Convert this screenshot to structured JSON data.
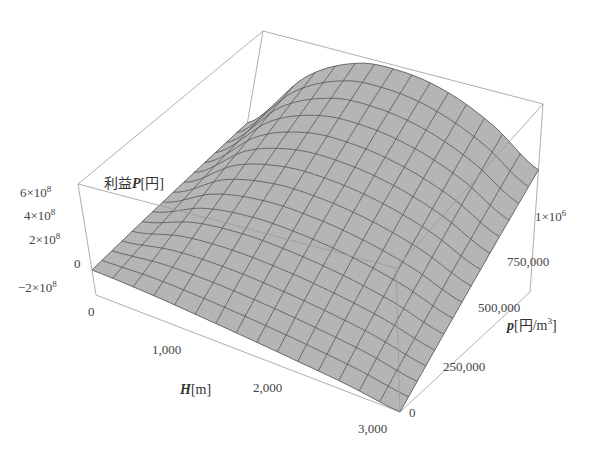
{
  "chart_data": {
    "type": "surface3d",
    "title": "",
    "x_axis": {
      "label_var": "H",
      "label_unit": "[m]",
      "ticks": [
        "0",
        "1,000",
        "2,000",
        "3,000"
      ],
      "range": [
        0,
        3000
      ]
    },
    "y_axis": {
      "label_var": "p",
      "label_unit": "[円/m",
      "label_unit_sup": "3",
      "label_unit_end": "]",
      "ticks": [
        "0",
        "250,000",
        "500,000",
        "750,000",
        "1×10"
      ],
      "tick_last_sup": "6",
      "range": [
        0,
        1000000
      ]
    },
    "z_axis": {
      "label_prefix": "利益",
      "label_var": "P",
      "label_unit": "[円]",
      "ticks": [
        {
          "mant": "6×10",
          "exp": "8"
        },
        {
          "mant": "4×10",
          "exp": "8"
        },
        {
          "mant": "2×10",
          "exp": "8"
        },
        {
          "mant": "0",
          "exp": ""
        },
        {
          "mant": "−2×10",
          "exp": "8"
        }
      ],
      "range": [
        -200000000,
        600000000
      ]
    },
    "surface": {
      "description": "Profit P as a function of height H and price p; rises with p, peaks at intermediate H near 1,000–1,500 m and falls toward H=3,000",
      "mesh_lines": 15,
      "samples_H": [
        0,
        500,
        1000,
        1500,
        2000,
        2500,
        3000
      ],
      "samples_p": [
        0,
        250000,
        500000,
        750000,
        1000000
      ],
      "P_at_p_max": [
        100000000,
        420000000,
        560000000,
        580000000,
        540000000,
        450000000,
        320000000
      ],
      "P_at_p_zero": [
        -20000000,
        -40000000,
        -70000000,
        -100000000,
        -130000000,
        -160000000,
        -200000000
      ]
    },
    "colors": {
      "surface": "#b4b4b4",
      "mesh": "#555555",
      "box": "#9a9a9a"
    },
    "layout": {
      "box": true,
      "grid": false,
      "legend": "none"
    }
  }
}
